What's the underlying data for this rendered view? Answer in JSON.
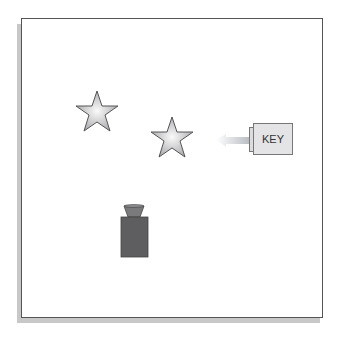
{
  "diagram": {
    "key_label": "KEY",
    "objects": [
      {
        "type": "star",
        "name": "star-1"
      },
      {
        "type": "star",
        "name": "star-2"
      },
      {
        "type": "key",
        "name": "key"
      },
      {
        "type": "weight",
        "name": "weight"
      }
    ],
    "colors": {
      "frame_border": "#555555",
      "shadow": "#c8c8c8",
      "star_fill": "#d8d8da",
      "star_stroke": "#555555",
      "key_fill": "#e4e4e6",
      "arrow": "#c8ccd0",
      "weight_body": "#5e5e60",
      "weight_cap": "#7a7a7c"
    }
  }
}
